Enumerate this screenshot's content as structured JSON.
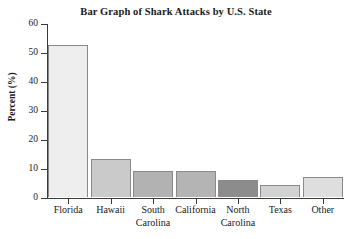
{
  "chart_data": {
    "type": "bar",
    "title": "Bar Graph of Shark Attacks by U.S. State",
    "xlabel": "",
    "ylabel": "Percent (%)",
    "ylim": [
      0,
      60
    ],
    "ytick_step": 10,
    "grid": false,
    "legend": "none",
    "categories": [
      "Florida",
      "Hawaii",
      "South\nCarolina",
      "California",
      "North\nCarolina",
      "Texas",
      "Other"
    ],
    "values": [
      52.5,
      13,
      9,
      9,
      6,
      4,
      7
    ],
    "yticks": [
      0,
      10,
      20,
      30,
      40,
      50,
      60
    ],
    "ytick_labels": [
      "0",
      "10",
      "20",
      "30",
      "40",
      "50",
      "60"
    ],
    "bar_colors": [
      "#eeeeee",
      "#cacaca",
      "#b2b2b2",
      "#b4b4b4",
      "#8c8c8c",
      "#d2d2d2",
      "#dedede"
    ],
    "bar_edge_color": "#8a8a8a",
    "axis_color": "#3b3b3b",
    "background_color": "#ffffff"
  }
}
